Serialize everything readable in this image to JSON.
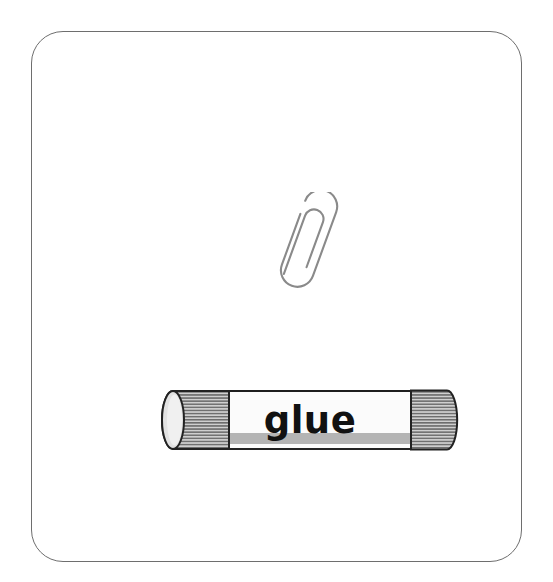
{
  "card": {
    "background_color": "#ffffff",
    "border_color": "#6e6e6e",
    "corner_radius_px": 32
  },
  "objects": [
    {
      "id": "paperclip",
      "label": "paperclip",
      "type": "line-drawing",
      "outline_color": "#8a8a8a",
      "fill_color": "#ffffff",
      "rotation_deg": 20
    },
    {
      "id": "glue-stick",
      "label": "glue stick",
      "type": "illustration",
      "printed_text": "glue",
      "body_color": "#fbfbfb",
      "stripe_color": "#b4b4b4",
      "cap_color": "#c9c9c9",
      "cap_rib_color": "#6a6a6a",
      "outline_color": "#222222",
      "text_color": "#111111"
    }
  ],
  "glue": {
    "text": "glue"
  }
}
